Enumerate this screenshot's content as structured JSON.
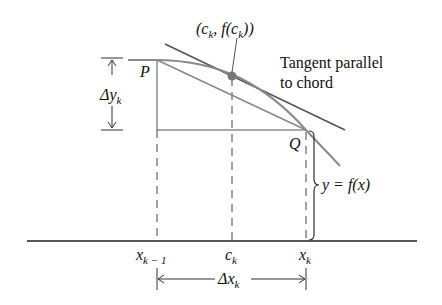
{
  "labels": {
    "point_c": "(c",
    "point_c_sub": "k",
    "point_c_mid": ", f(c",
    "point_c_sub2": "k",
    "point_c_end": "))",
    "tangent_line1": "Tangent parallel",
    "tangent_line2": "to chord",
    "P": "P",
    "Q": "Q",
    "delta_y": "Δy",
    "delta_y_sub": "k",
    "function": "y = f(x)",
    "x_prev": "x",
    "x_prev_sub": "k − 1",
    "c_k": "c",
    "c_k_sub": "k",
    "x_k": "x",
    "x_k_sub": "k",
    "delta_x": "Δx",
    "delta_x_sub": "k"
  },
  "colors": {
    "curve": "#8a8a8a",
    "lines": "#555555",
    "axis": "#222222",
    "text": "#111111",
    "point": "#777777"
  }
}
